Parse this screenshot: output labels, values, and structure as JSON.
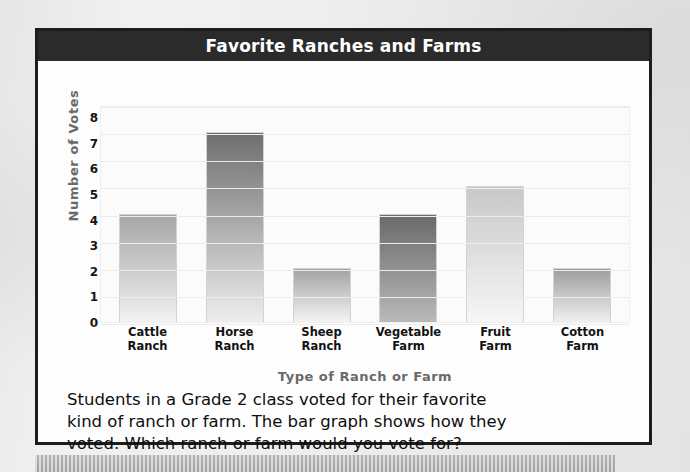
{
  "title": "Favorite Ranches and Farms",
  "chart_data": {
    "type": "bar",
    "title": "Favorite Ranches and Farms",
    "xlabel": "Type of Ranch or Farm",
    "ylabel": "Number of Votes",
    "categories": [
      "Cattle Ranch",
      "Horse Ranch",
      "Sheep Ranch",
      "Vegetable Farm",
      "Fruit Farm",
      "Cotton Farm"
    ],
    "category_lines": [
      [
        "Cattle",
        "Ranch"
      ],
      [
        "Horse",
        "Ranch"
      ],
      [
        "Sheep",
        "Ranch"
      ],
      [
        "Vegetable",
        "Farm"
      ],
      [
        "Fruit",
        "Farm"
      ],
      [
        "Cotton",
        "Farm"
      ]
    ],
    "values": [
      4,
      7,
      2,
      4,
      5,
      2
    ],
    "ylim": [
      0,
      8
    ],
    "yticks": [
      8,
      7,
      6,
      5,
      4,
      3,
      2,
      1,
      0
    ],
    "grid": true,
    "legend": "none",
    "bar_top_colors": [
      "#a6a6a6",
      "#6e6e6e",
      "#a3a3a3",
      "#6a6a6a",
      "#c8c8c8",
      "#9d9d9d"
    ],
    "bar_bottom_colors": [
      "#f2f2f2",
      "#eeeeee",
      "#f4f4f4",
      "#b9b9b9",
      "#f6f6f6",
      "#f0f0f0"
    ]
  },
  "caption": {
    "lines": [
      "Students in a Grade 2 class voted for their favorite",
      "kind of ranch or farm. The bar graph shows how they",
      "voted. Which ranch or farm would you vote for?"
    ]
  }
}
